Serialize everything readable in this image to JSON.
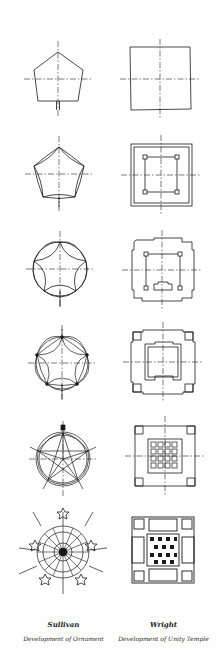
{
  "figure": {
    "columns": [
      {
        "id": "sullivan",
        "author": "Sullivan",
        "subtitle": "Development of Ornament",
        "stages": [
          "pentagon",
          "pentagon-concave-sides",
          "pentagon-lobed-circle",
          "pentagon-double-lobes",
          "pentagon-star-rosette",
          "radiating-ornament"
        ]
      },
      {
        "id": "wright",
        "author": "Wright",
        "subtitle": "Development of Unity Temple",
        "stages": [
          "square",
          "double-square-with-corner-piers",
          "stepped-outline-plan",
          "nested-stepped-plan",
          "plan-with-coffered-grid",
          "full-temple-plan"
        ]
      }
    ],
    "colors": {
      "ink": "#1a1a1a",
      "paper": "#ffffff"
    }
  }
}
